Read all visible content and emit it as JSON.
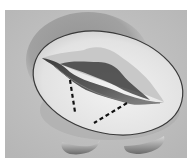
{
  "figure": {
    "style": "grayscale medical drawing",
    "colors": {
      "page_background": "#ffffff",
      "panel_background": "#bdbdbd",
      "outer_shadow": "#8f8f8f",
      "annulus_fill": "#e9e9e9",
      "annulus_outline": "#3a3a3a",
      "leaflet_light": "#d2d2d2",
      "orifice_dark": "#4a4a4a",
      "incision_line": "#111111"
    },
    "elements": [
      "outer-ring-shadow",
      "annulus-ellipse",
      "valve-orifice",
      "incision-line-left",
      "incision-line-bottom",
      "papillary-left",
      "papillary-right"
    ]
  }
}
